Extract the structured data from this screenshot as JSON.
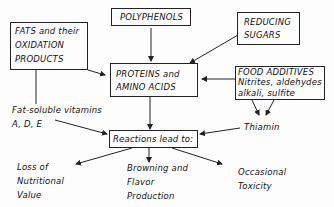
{
  "diagram": {
    "nodes": {
      "fats": {
        "lines": [
          "FATS and their",
          "OXIDATION",
          "PRODUCTS"
        ]
      },
      "polyphenols": {
        "label": "POLYPHENOLS"
      },
      "reducing_sugars": {
        "lines": [
          "REDUCING",
          "SUGARS"
        ]
      },
      "proteins": {
        "lines": [
          "PROTEINS and",
          "AMINO ACIDS"
        ]
      },
      "food_additives": {
        "lines": [
          "FOOD ADDITIVES",
          "Nitrites, aldehydes",
          "alkali, sulfite"
        ]
      },
      "vitamins": {
        "lines": [
          "Fat-soluble vitamins",
          "A, D, E"
        ]
      },
      "thiamin": {
        "label": "Thiamin"
      },
      "reactions": {
        "label": "Reactions lead to:"
      },
      "loss": {
        "lines": [
          "Loss of",
          "Nutritional",
          "Value"
        ]
      },
      "browning": {
        "lines": [
          "Browning and",
          "Flavor",
          "Production"
        ]
      },
      "toxicity": {
        "lines": [
          "Occasional",
          "Toxicity"
        ]
      }
    },
    "edges": [
      {
        "from": "polyphenols",
        "to": "proteins"
      },
      {
        "from": "reducing_sugars",
        "to": "proteins"
      },
      {
        "from": "fats",
        "to": "proteins"
      },
      {
        "from": "fats",
        "to": "vitamins"
      },
      {
        "from": "food_additives",
        "to": "proteins"
      },
      {
        "from": "food_additives",
        "to": "thiamin"
      },
      {
        "from": "proteins",
        "to": "reactions"
      },
      {
        "from": "vitamins",
        "to": "reactions"
      },
      {
        "from": "thiamin",
        "to": "reactions"
      },
      {
        "from": "reactions",
        "to": "loss"
      },
      {
        "from": "reactions",
        "to": "browning"
      },
      {
        "from": "reactions",
        "to": "toxicity"
      }
    ]
  }
}
